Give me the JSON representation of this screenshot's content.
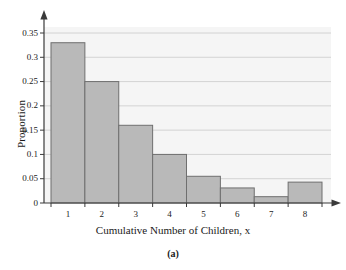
{
  "chart_data": {
    "type": "bar",
    "title": "",
    "subtitle": "",
    "caption": "(a)",
    "xlabel": "Cumulative Number of Children, x",
    "ylabel": "Proportion",
    "categories": [
      "1",
      "2",
      "3",
      "4",
      "5",
      "6",
      "7",
      "8"
    ],
    "values": [
      0.33,
      0.25,
      0.16,
      0.1,
      0.055,
      0.031,
      0.013,
      0.043
    ],
    "series": [
      {
        "name": "Proportion",
        "values": [
          0.33,
          0.25,
          0.16,
          0.1,
          0.055,
          0.031,
          0.013,
          0.043
        ]
      }
    ],
    "ylim": [
      0,
      0.35
    ],
    "xlim": [
      0.5,
      8.5
    ],
    "ytick_labels": [
      "0",
      "0.05",
      "0.1",
      "0.15",
      "0.2",
      "0.25",
      "0.3",
      "0.35"
    ],
    "ytick_values": [
      0,
      0.05,
      0.1,
      0.15,
      0.2,
      0.25,
      0.3,
      0.35
    ],
    "xtick_labels": [
      "1",
      "2",
      "3",
      "4",
      "5",
      "6",
      "7",
      "8"
    ],
    "grid": "horizontal",
    "legend": "none",
    "bar_fill": "#b9b9b9",
    "bar_stroke": "#6f6f6f",
    "plot_background": "#f5f5f5",
    "axis_color": "#3a3a3a",
    "gridline_color": "#cfcfcf"
  }
}
